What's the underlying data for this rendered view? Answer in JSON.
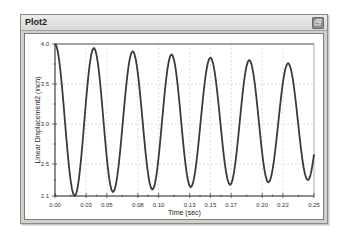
{
  "window": {
    "title": "Plot2",
    "close_icon": "restore-icon"
  },
  "colors": {
    "curve": "#3a3a3a",
    "grid": "#c8c8c8",
    "frame": "#d4d0c8"
  },
  "chart_data": {
    "type": "line",
    "title": "",
    "xlabel": "Time (sec)",
    "ylabel": "Linear Displacement2 (inch)",
    "xlim": [
      0.0,
      0.25
    ],
    "ylim": [
      2.1,
      4.0
    ],
    "x_ticks": [
      "0.00",
      "0.03",
      "0.05",
      "0.08",
      "0.10",
      "0.13",
      "0.15",
      "0.17",
      "0.20",
      "0.22",
      "0.25"
    ],
    "y_ticks": [
      "4.0",
      "3.5",
      "3.0",
      "2.5",
      "2.1"
    ],
    "grid": true,
    "legend": null,
    "series": [
      {
        "name": "Linear Displacement2",
        "description": "damped oscillation, period ~0.0375 s",
        "peaks": [
          {
            "x": 0.0,
            "y": 4.0
          },
          {
            "x": 0.0375,
            "y": 3.95
          },
          {
            "x": 0.075,
            "y": 3.91
          },
          {
            "x": 0.1125,
            "y": 3.87
          },
          {
            "x": 0.15,
            "y": 3.83
          },
          {
            "x": 0.1875,
            "y": 3.8
          },
          {
            "x": 0.225,
            "y": 3.76
          }
        ],
        "troughs": [
          {
            "x": 0.019,
            "y": 2.1
          },
          {
            "x": 0.056,
            "y": 2.15
          },
          {
            "x": 0.094,
            "y": 2.18
          },
          {
            "x": 0.131,
            "y": 2.21
          },
          {
            "x": 0.169,
            "y": 2.24
          },
          {
            "x": 0.206,
            "y": 2.27
          },
          {
            "x": 0.244,
            "y": 2.3
          }
        ],
        "end": {
          "x": 0.25,
          "y": 3.28
        }
      }
    ]
  }
}
